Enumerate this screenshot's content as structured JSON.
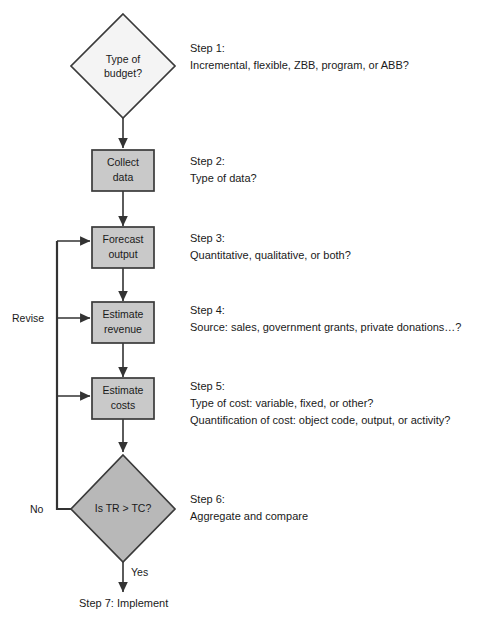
{
  "diagram": {
    "colors": {
      "decision_start_fill": "#f4f4f4",
      "decision_end_fill": "#b8b8b8",
      "process_fill": "#c9c9c9",
      "outline": "#3a3a3a",
      "line": "#333333",
      "text": "#1a1a1a",
      "background": "#ffffff"
    },
    "nodes": [
      {
        "id": "type-of-budget",
        "shape": "decision",
        "lines": [
          "Type of",
          "budget?"
        ],
        "line1": "Type of",
        "line2": "budget?"
      },
      {
        "id": "collect-data",
        "shape": "process",
        "line1": "Collect",
        "line2": "data"
      },
      {
        "id": "forecast-output",
        "shape": "process",
        "line1": "Forecast",
        "line2": "output"
      },
      {
        "id": "estimate-revenue",
        "shape": "process",
        "line1": "Estimate",
        "line2": "revenue"
      },
      {
        "id": "estimate-costs",
        "shape": "process",
        "line1": "Estimate",
        "line2": "costs"
      },
      {
        "id": "is-tr-gt-tc",
        "shape": "decision",
        "line1": "Is TR > TC?",
        "line2": ""
      }
    ],
    "steps": [
      {
        "id": "step-1",
        "heading": "Step 1:",
        "detail1": "Incremental, flexible, ZBB, program, or ABB?",
        "detail2": "",
        "detail3": ""
      },
      {
        "id": "step-2",
        "heading": "Step 2:",
        "detail1": "Type of data?",
        "detail2": "",
        "detail3": ""
      },
      {
        "id": "step-3",
        "heading": "Step 3:",
        "detail1": "Quantitative, qualitative, or both?",
        "detail2": "",
        "detail3": ""
      },
      {
        "id": "step-4",
        "heading": "Step 4:",
        "detail1": "Source: sales, government grants, private donations…?",
        "detail2": "",
        "detail3": ""
      },
      {
        "id": "step-5",
        "heading": "Step 5:",
        "detail1": "Type of cost: variable, fixed, or other?",
        "detail2": "Quantification of cost: object code, output, or activity?",
        "detail3": ""
      },
      {
        "id": "step-6",
        "heading": "Step 6:",
        "detail1": "Aggregate and compare",
        "detail2": "",
        "detail3": ""
      }
    ],
    "edge_labels": {
      "revise": "Revise",
      "no": "No",
      "yes": "Yes"
    },
    "terminal": {
      "label": "Step 7: Implement"
    }
  }
}
